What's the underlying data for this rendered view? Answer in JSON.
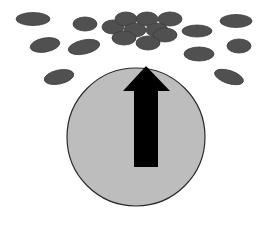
{
  "colors": {
    "background": "#ffffff",
    "particle_fill": "#505050",
    "particle_stroke": "#3e3e3e",
    "cell_fill": "#bdbdbd",
    "cell_stroke": "#2a2a2a",
    "arrow_fill": "#000000"
  },
  "cell": {
    "cx": 136,
    "cy": 137,
    "r": 69
  },
  "arrow": {
    "direction": "up",
    "points": "146,66 170,91 158,91 158,167 134,167 134,91 123,91"
  },
  "particles": [
    {
      "cx": 33,
      "cy": 19,
      "rx": 17,
      "ry": 6.5,
      "rot": 0
    },
    {
      "cx": 85,
      "cy": 24,
      "rx": 12,
      "ry": 7,
      "rot": 0
    },
    {
      "cx": 45,
      "cy": 45,
      "rx": 15,
      "ry": 7,
      "rot": -10
    },
    {
      "cx": 84,
      "cy": 47,
      "rx": 16,
      "ry": 7,
      "rot": -12
    },
    {
      "cx": 59,
      "cy": 77,
      "rx": 15,
      "ry": 7,
      "rot": -12
    },
    {
      "cx": 113,
      "cy": 27,
      "rx": 11,
      "ry": 7,
      "rot": 0
    },
    {
      "cx": 126,
      "cy": 19,
      "rx": 11,
      "ry": 7,
      "rot": 0
    },
    {
      "cx": 147,
      "cy": 19,
      "rx": 11,
      "ry": 7,
      "rot": 0
    },
    {
      "cx": 170,
      "cy": 19,
      "rx": 12,
      "ry": 7,
      "rot": 0
    },
    {
      "cx": 135,
      "cy": 30,
      "rx": 11,
      "ry": 7,
      "rot": 0
    },
    {
      "cx": 157,
      "cy": 30,
      "rx": 11,
      "ry": 7,
      "rot": 0
    },
    {
      "cx": 124,
      "cy": 38,
      "rx": 12,
      "ry": 7,
      "rot": 0
    },
    {
      "cx": 165,
      "cy": 35,
      "rx": 12,
      "ry": 7,
      "rot": 0
    },
    {
      "cx": 148,
      "cy": 43,
      "rx": 12,
      "ry": 7,
      "rot": 0
    },
    {
      "cx": 197,
      "cy": 31,
      "rx": 15,
      "ry": 6,
      "rot": 0
    },
    {
      "cx": 236,
      "cy": 21,
      "rx": 16,
      "ry": 6.5,
      "rot": 0
    },
    {
      "cx": 239,
      "cy": 46,
      "rx": 12,
      "ry": 7,
      "rot": 0
    },
    {
      "cx": 199,
      "cy": 54,
      "rx": 15,
      "ry": 7,
      "rot": 0
    },
    {
      "cx": 229,
      "cy": 77,
      "rx": 15,
      "ry": 6.5,
      "rot": 18
    }
  ]
}
